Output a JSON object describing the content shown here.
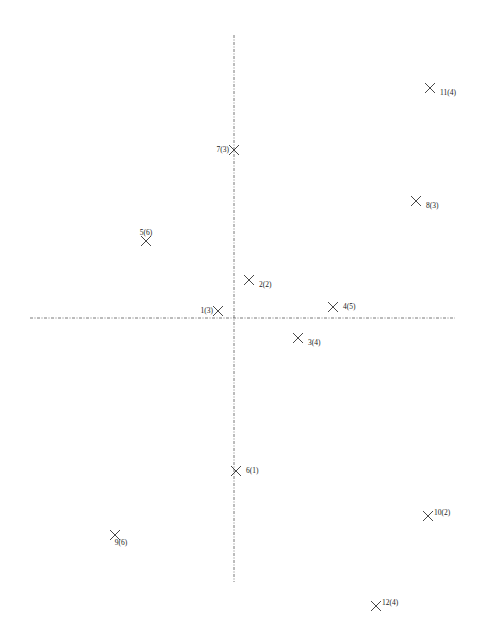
{
  "chart_data": {
    "type": "scatter",
    "title": "",
    "xlabel": "",
    "ylabel": "",
    "grid": false,
    "legend": null,
    "marker": "x",
    "axes": {
      "style": "dash-dot lines through origin",
      "origin_px": [
        234,
        318
      ],
      "vertical_extent_px": [
        35,
        582
      ],
      "horizontal_extent_px": [
        30,
        455
      ]
    },
    "points": [
      {
        "id": 1,
        "group": 3,
        "label": "1(3)",
        "x": -16,
        "y": 7,
        "px": [
          218,
          311
        ],
        "label_pos": "left"
      },
      {
        "id": 2,
        "group": 2,
        "label": "2(2)",
        "x": 15,
        "y": 38,
        "px": [
          249,
          280
        ],
        "label_pos": "below-right"
      },
      {
        "id": 3,
        "group": 4,
        "label": "3(4)",
        "x": 64,
        "y": -20,
        "px": [
          298,
          338
        ],
        "label_pos": "below-right"
      },
      {
        "id": 4,
        "group": 5,
        "label": "4(5)",
        "x": 99,
        "y": 11,
        "px": [
          333,
          307
        ],
        "label_pos": "right"
      },
      {
        "id": 5,
        "group": 6,
        "label": "5(6)",
        "x": -88,
        "y": 77,
        "px": [
          146,
          241
        ],
        "label_pos": "above"
      },
      {
        "id": 6,
        "group": 1,
        "label": "6(1)",
        "x": 2,
        "y": -153,
        "px": [
          236,
          471
        ],
        "label_pos": "right"
      },
      {
        "id": 7,
        "group": 3,
        "label": "7(3)",
        "x": 0,
        "y": 168,
        "px": [
          234,
          150
        ],
        "label_pos": "left"
      },
      {
        "id": 8,
        "group": 3,
        "label": "8(3)",
        "x": 182,
        "y": 117,
        "px": [
          416,
          201
        ],
        "label_pos": "below-right"
      },
      {
        "id": 9,
        "group": 6,
        "label": "9(6)",
        "x": -119,
        "y": -217,
        "px": [
          115,
          535
        ],
        "label_pos": "below"
      },
      {
        "id": 10,
        "group": 2,
        "label": "10(2)",
        "x": 194,
        "y": -198,
        "px": [
          428,
          516
        ],
        "label_pos": "above-right"
      },
      {
        "id": 11,
        "group": 4,
        "label": "11(4)",
        "x": 196,
        "y": 230,
        "px": [
          430,
          88
        ],
        "label_pos": "below-right"
      },
      {
        "id": 12,
        "group": 4,
        "label": "12(4)",
        "x": 142,
        "y": -288,
        "px": [
          376,
          606
        ],
        "label_pos": "above-right"
      }
    ]
  },
  "colors": {
    "background": "#ffffff",
    "marker": "#333333",
    "axis": "#555555",
    "text": "#1a1a1a"
  }
}
